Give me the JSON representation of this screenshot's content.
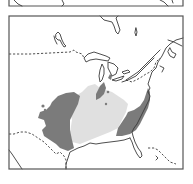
{
  "figure": {
    "type": "range-map",
    "region": "Eastern North America",
    "panels": [
      {
        "id": "top-panel",
        "visible": "partial"
      },
      {
        "id": "main-panel",
        "visible": "full"
      }
    ]
  },
  "legend_colors": {
    "dark_range": "#7b7b7b",
    "light_range": "#e0e0e0",
    "land": "#ffffff",
    "outline": "#3a3a3a"
  },
  "features": {
    "range_dark_west": "Dark-shaded range (western block, Great Plains to Gulf coast)",
    "range_light_central": "Light-shaded range (central Mississippi/Ohio valley)",
    "range_dark_southeast": "Dark-shaded range (southeastern Atlantic coast)",
    "range_dark_north_patch": "Dark-shaded patch (lower Michigan / Indiana)",
    "international_border": "US–Canada border (dashed)",
    "mexico_border": "US–Mexico border (dashed)"
  }
}
